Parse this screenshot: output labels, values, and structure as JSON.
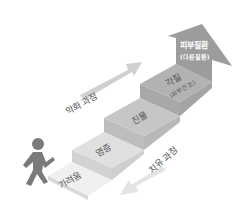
{
  "diagram": {
    "type": "staircase-progression",
    "steps": [
      {
        "label": "가려움",
        "color": "#eeeeee"
      },
      {
        "label": "염증",
        "color": "#dcdcdc"
      },
      {
        "label": "진물",
        "color": "#c4c4c4"
      },
      {
        "label": "각질",
        "sublabel": "(피부건조)",
        "color": "#b0b0b0"
      }
    ],
    "top_arrow": {
      "label": "피부질환",
      "sublabel": "(다른질환)",
      "color": "#9a9a9a"
    },
    "worsening_arrow": {
      "label": "악화 과정",
      "color": "#cfcfcf"
    },
    "healing_arrow": {
      "label": "치유 과정",
      "color": "#e2e2e2"
    },
    "figure": {
      "icon": "walking-person-icon",
      "color": "#7a7a7a"
    }
  }
}
